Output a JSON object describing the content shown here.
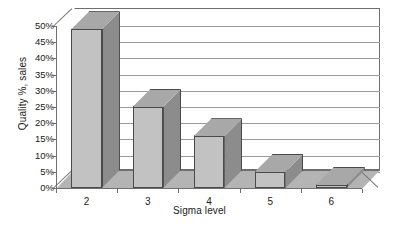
{
  "chart_data": {
    "type": "bar",
    "title": "",
    "xlabel": "Sigma level",
    "ylabel": "Quality %, sales",
    "categories": [
      "2",
      "3",
      "4",
      "5",
      "6"
    ],
    "values": [
      49,
      25,
      16,
      5,
      1
    ],
    "ytick_labels": [
      "50%",
      "45%",
      "40%",
      "35%",
      "30%",
      "25%",
      "20%",
      "15%",
      "10%",
      "5%",
      "0%"
    ],
    "ytick_values": [
      50,
      45,
      40,
      35,
      30,
      25,
      20,
      15,
      10,
      5,
      0
    ],
    "ylim": [
      0,
      50
    ],
    "grid": true,
    "legend": false,
    "style": "3d-column",
    "colors": {
      "bar_front": "#c2c2c2",
      "bar_side": "#8c8c8c",
      "bar_top": "#a8a8a8",
      "bar_edge": "#4a4a4a",
      "floor": "#b4b4b4",
      "gridline": "#9a9a9a",
      "frame": "#6f6f6f",
      "background": "#ffffff",
      "text": "#1a1a1a"
    }
  }
}
